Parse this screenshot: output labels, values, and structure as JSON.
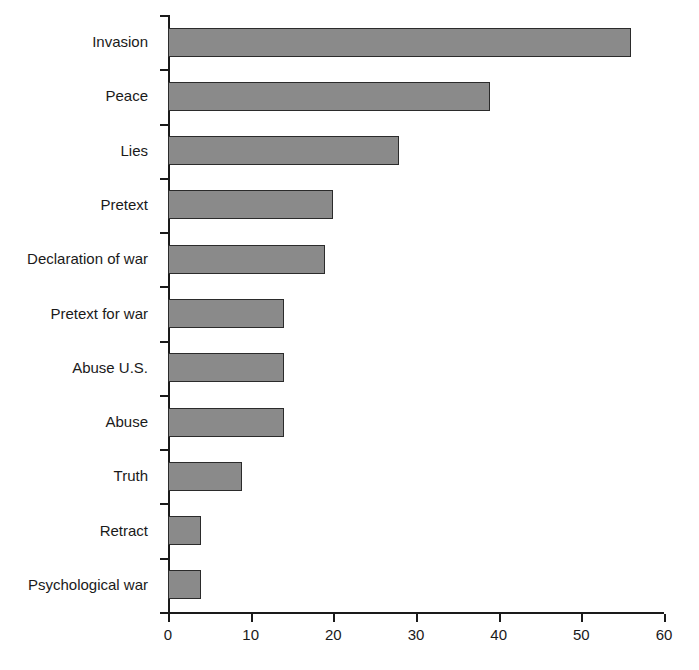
{
  "chart_data": {
    "type": "bar",
    "orientation": "horizontal",
    "title": "",
    "subtitle": "",
    "xlabel": "",
    "ylabel": "",
    "categories": [
      "Invasion",
      "Peace",
      "Lies",
      "Pretext",
      "Declaration of war",
      "Pretext for war",
      "Abuse U.S.",
      "Abuse",
      "Truth",
      "Retract",
      "Psychological war"
    ],
    "values": [
      56,
      39,
      28,
      20,
      19,
      14,
      14,
      14,
      9,
      4,
      4
    ],
    "xlim": [
      0,
      60
    ],
    "xticks": [
      0,
      10,
      20,
      30,
      40,
      50,
      60
    ],
    "xtick_labels": [
      "0",
      "10",
      "20",
      "30",
      "40",
      "50",
      "60"
    ],
    "grid": false,
    "legend": false,
    "legend_position": "none",
    "bar_fill_color": "#8a8a8a",
    "bar_border_color": "#2b2b2b",
    "axis_color": "#1a1a1a",
    "background_color": "#ffffff"
  }
}
